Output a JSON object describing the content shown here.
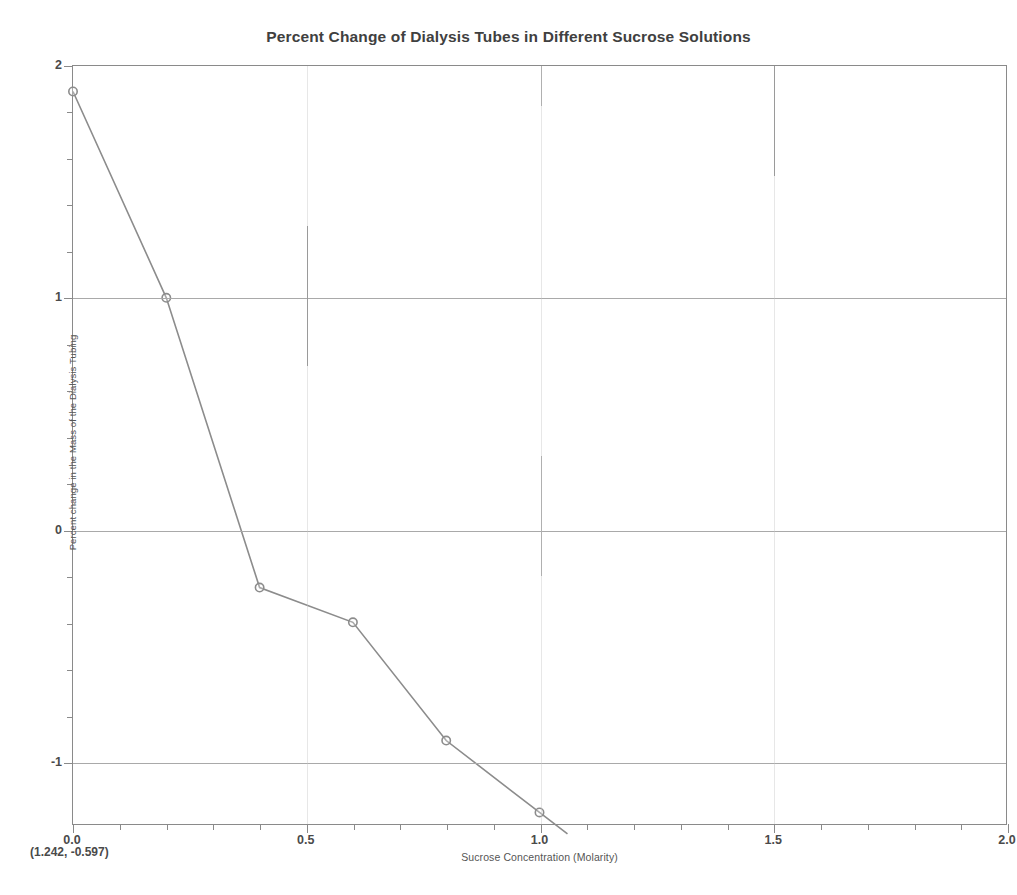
{
  "chart_data": {
    "type": "line",
    "title": "Percent Change of Dialysis Tubes in Different Sucrose Solutions",
    "xlabel": "Sucrose Concentration (Molarity)",
    "ylabel": "Percent change in the Mass of the Dialysis Tubing",
    "x": [
      0.0,
      0.2,
      0.4,
      0.6,
      0.8,
      1.0
    ],
    "values": [
      1.89,
      1.0,
      -0.25,
      -0.4,
      -0.91,
      -1.22
    ],
    "series": [
      {
        "name": "Percent change in mass",
        "x": [
          0.0,
          0.2,
          0.4,
          0.6,
          0.8,
          1.0
        ],
        "values": [
          1.89,
          1.0,
          -0.25,
          -0.4,
          -0.91,
          -1.22
        ]
      }
    ],
    "xlim": [
      0.0,
      2.0
    ],
    "ylim": [
      -1.27,
      2.0
    ],
    "xticks": [
      0.0,
      0.5,
      1.0,
      1.5,
      2.0
    ],
    "xticklabels": [
      "0.0",
      "0.5",
      "1.0",
      "1.5",
      "2.0"
    ],
    "xticks_minor": [
      0.1,
      0.2,
      0.3,
      0.4,
      0.6,
      0.7,
      0.8,
      0.9,
      1.1,
      1.2,
      1.3,
      1.4,
      1.6,
      1.7,
      1.8,
      1.9
    ],
    "yticks": [
      -1,
      0,
      1,
      2
    ],
    "yticklabels": [
      "-1",
      "0",
      "1",
      "2"
    ],
    "yticks_minor": [
      -0.8,
      -0.6,
      -0.4,
      -0.2,
      0.2,
      0.4,
      0.6,
      0.8,
      1.2,
      1.4,
      1.6,
      1.8
    ],
    "grid": true,
    "grid_axis": "both",
    "legend": false,
    "line_color": "#8c8c8c",
    "marker": "circle-open",
    "marker_color": "#8c8c8c",
    "annotations": [
      {
        "name": "coordinate-readout",
        "text": "(1.242, -0.597)"
      }
    ]
  },
  "colors": {
    "line": "#8c8c8c",
    "grid_major": "#a9a9a9",
    "grid_vertical": "#c6c6c6",
    "frame": "#8a8a8a",
    "text": "#4a4a4a",
    "background": "#ffffff"
  }
}
